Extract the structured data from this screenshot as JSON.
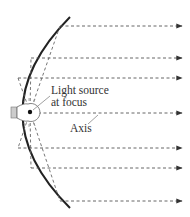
{
  "diagram": {
    "labels": {
      "source_line1": "Light source",
      "source_line2": "at focus",
      "axis": "Axis"
    },
    "rays": [
      {
        "id": "ray-1"
      },
      {
        "id": "ray-2"
      },
      {
        "id": "ray-3"
      },
      {
        "id": "axis-ray"
      },
      {
        "id": "ray-5"
      },
      {
        "id": "ray-6"
      },
      {
        "id": "ray-7"
      }
    ],
    "colors": {
      "mirror": "#222222",
      "rays": "#555555",
      "text": "#333333"
    }
  }
}
